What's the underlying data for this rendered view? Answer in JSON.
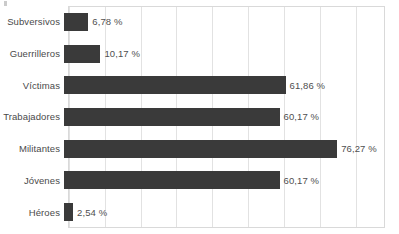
{
  "chart_data": {
    "type": "bar",
    "orientation": "horizontal",
    "title": "",
    "subtitle": "",
    "xlabel": "",
    "ylabel": "",
    "xlim": [
      0,
      88.5
    ],
    "grid": true,
    "legend": null,
    "value_suffix": " %",
    "bar_color": "#3a3a3a",
    "gridline_color": "#e2e2e2",
    "border_color": "#d9d9d9",
    "label_color": "#4a4a4a",
    "gridline_values": [
      0,
      10,
      20,
      30,
      40,
      50,
      60,
      70,
      80
    ],
    "tick_labels": [],
    "categories": [
      "Subversivos",
      "Guerrilleros",
      "Víctimas",
      "Trabajadores",
      "Militantes",
      "Jóvenes",
      "Héroes"
    ],
    "values": [
      6.78,
      10.17,
      61.86,
      60.17,
      76.27,
      60.17,
      2.54
    ],
    "value_labels": [
      "6,78 %",
      "10,17 %",
      "61,86 %",
      "60,17 %",
      "76,27 %",
      "60,17 %",
      "2,54 %"
    ]
  }
}
